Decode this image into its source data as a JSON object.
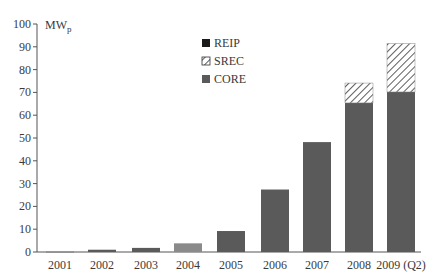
{
  "chart_data": {
    "type": "bar",
    "stacked": true,
    "title": "",
    "xlabel": "",
    "ylabel": "MWp",
    "ylabel_main": "MW",
    "ylabel_sub": "p",
    "ylim": [
      0,
      100
    ],
    "yticks": [
      0,
      10,
      20,
      30,
      40,
      50,
      60,
      70,
      80,
      90,
      100
    ],
    "grid": false,
    "legend_position": "top-center",
    "categories": [
      "2001",
      "2002",
      "2003",
      "2004",
      "2005",
      "2006",
      "2007",
      "2008",
      "2009 (Q2)"
    ],
    "series": [
      {
        "name": "REIP",
        "color": "#1a1a1a",
        "pattern": "solid",
        "values": [
          0,
          0,
          0,
          0,
          0,
          0,
          0,
          0,
          0
        ]
      },
      {
        "name": "SREC",
        "color": "#ffffff",
        "pattern": "diagonal-hatch",
        "values": [
          0,
          0,
          0,
          0,
          0,
          0,
          0,
          8.7,
          21.2
        ]
      },
      {
        "name": "CORE",
        "color": "#5a5a5a",
        "pattern": "solid",
        "values": [
          0.1,
          1.0,
          1.8,
          3.8,
          9.2,
          27.4,
          48.2,
          65.4,
          70.2
        ]
      }
    ],
    "totals": [
      0.1,
      1.0,
      1.8,
      3.8,
      9.2,
      27.4,
      48.2,
      74.1,
      91.4
    ]
  },
  "legend": [
    {
      "label": "REIP",
      "icon": "solid-black-square"
    },
    {
      "label": "SREC",
      "icon": "hatched-square"
    },
    {
      "label": "CORE",
      "icon": "solid-gray-square"
    }
  ]
}
